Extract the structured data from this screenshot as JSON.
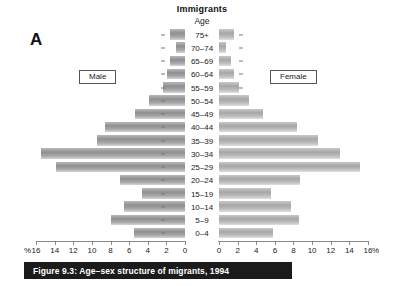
{
  "figure": {
    "panel_letter": "A",
    "chart_title": "Immigrants",
    "age_header": "Age",
    "caption": "Figure 9.3: Age–sex structure of migrants, 1994",
    "percent_symbol_left": "%",
    "percent_symbol_right": "%"
  },
  "legend": {
    "male_label": "Male",
    "female_label": "Female"
  },
  "chart_data": {
    "type": "bar",
    "subtype": "population-pyramid",
    "title": "Immigrants",
    "xlabel": "%",
    "ylabel": "Age",
    "xlim": [
      0,
      16
    ],
    "grid": false,
    "legend_position": "inside-top-left-and-top-right",
    "axis_ticks": [
      0,
      2,
      4,
      6,
      8,
      10,
      12,
      14,
      16
    ],
    "tick_labels": [
      "0",
      "2",
      "4",
      "6",
      "8",
      "10",
      "12",
      "14",
      "16"
    ],
    "categories": [
      "75+",
      "70–74",
      "65–69",
      "60–64",
      "55–59",
      "50–54",
      "45–49",
      "40–44",
      "35–39",
      "30–34",
      "25–29",
      "20–24",
      "15–19",
      "10–14",
      "5–9",
      "0–4"
    ],
    "series": [
      {
        "name": "Male",
        "side": "left",
        "values": [
          1.6,
          1.0,
          1.6,
          1.9,
          2.4,
          3.9,
          5.4,
          8.6,
          9.4,
          15.5,
          13.9,
          7.0,
          4.6,
          6.5,
          8.0,
          5.5
        ]
      },
      {
        "name": "Female",
        "side": "right",
        "values": [
          1.6,
          0.8,
          1.3,
          1.6,
          2.1,
          3.2,
          4.7,
          8.4,
          10.6,
          13.0,
          15.1,
          8.7,
          5.6,
          7.7,
          8.6,
          5.8
        ]
      }
    ]
  },
  "colors": {
    "bar_male": "#8f8f8f",
    "bar_female": "#a6a6a6",
    "caption_bg": "#1b1b1b",
    "caption_text": "#ffffff",
    "axis": "#8a8a8a"
  }
}
